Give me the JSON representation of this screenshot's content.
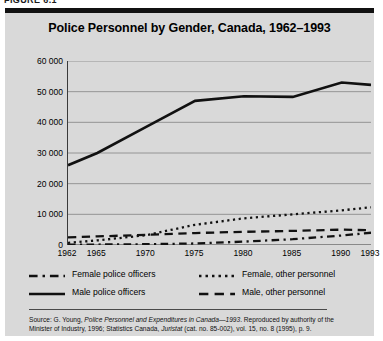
{
  "figure": {
    "number_label": "FIGURE 6.1"
  },
  "chart_data": {
    "type": "line",
    "title": "Police Personnel by Gender, Canada, 1962–1993",
    "xlabel": "",
    "ylabel": "",
    "x": [
      1962,
      1965,
      1970,
      1975,
      1980,
      1985,
      1990,
      1993
    ],
    "xtick_labels": [
      "1962",
      "1965",
      "1970",
      "1975",
      "1980",
      "1985",
      "1990",
      "1993"
    ],
    "xlim": [
      1962,
      1993
    ],
    "ylim": [
      0,
      60000
    ],
    "ytick_values": [
      0,
      10000,
      20000,
      30000,
      40000,
      50000,
      60000
    ],
    "ytick_labels": [
      "0",
      "10 000",
      "20 000",
      "30 000",
      "40 000",
      "50 000",
      "60 000"
    ],
    "grid": true,
    "grid_axis": "y",
    "legend_position": "below-plot",
    "series": [
      {
        "name": "Male police officers",
        "style": "solid",
        "color": "#111111",
        "values": [
          26000,
          30000,
          38500,
          47000,
          48500,
          48300,
          53000,
          52200
        ]
      },
      {
        "name": "Female, other personnel",
        "style": "dotted",
        "color": "#111111",
        "values": [
          700,
          1500,
          3200,
          6600,
          8700,
          10000,
          11300,
          12300
        ]
      },
      {
        "name": "Male, other personnel",
        "style": "dashed",
        "color": "#111111",
        "values": [
          2500,
          2800,
          3300,
          3900,
          4300,
          4600,
          5000,
          4800
        ]
      },
      {
        "name": "Female police officers",
        "style": "dash-dot",
        "color": "#111111",
        "values": [
          100,
          150,
          250,
          500,
          1100,
          1900,
          3100,
          4000
        ]
      }
    ]
  },
  "legend": {
    "items": [
      {
        "label": "Female police officers",
        "style": "dash-dot"
      },
      {
        "label": "Female, other personnel",
        "style": "dotted"
      },
      {
        "label": "Male police officers",
        "style": "solid"
      },
      {
        "label": "Male, other personnel",
        "style": "dashed"
      }
    ]
  },
  "source": {
    "line1_prefix": "Source: G. Young, ",
    "line1_italic": "Police Personnel and Expenditures in Canada—1993",
    "line1_suffix": ". Reproduced by authority of the",
    "line2_prefix": "Minister of Industry, 1996; Statistics Canada, ",
    "line2_italic": "Juristat",
    "line2_suffix": " (cat. no. 85-002), vol. 15, no. 8 (1995), p. 9."
  }
}
